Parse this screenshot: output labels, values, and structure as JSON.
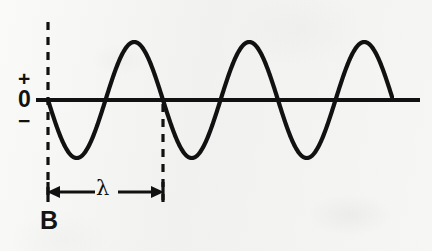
{
  "figure": {
    "panel_letter": "B",
    "background_color": "#f2f2f0",
    "ink_color": "#111111",
    "width": 432,
    "height": 251
  },
  "axis": {
    "plus_label": "+",
    "zero_label": "0",
    "minus_label": "−",
    "baseline_y": 100,
    "x_start": 36,
    "x_end": 420,
    "line_width": 4
  },
  "annotations": {
    "wavelength_symbol": "λ",
    "wavelength_arrow": {
      "y": 192,
      "x_start": 48,
      "x_end": 163,
      "style": "double-headed"
    },
    "marker_lines": [
      {
        "name": "wave-start-marker",
        "x": 48,
        "y_top": 22,
        "y_bottom": 200,
        "style": "dashed"
      },
      {
        "name": "wavelength-end-marker",
        "x": 163,
        "y_top": 104,
        "y_bottom": 200,
        "style": "dashed"
      }
    ]
  },
  "chart_data": {
    "type": "line",
    "title": "",
    "xlabel": "",
    "ylabel": "",
    "subtitle": "",
    "grid": false,
    "legend": null,
    "waveform": "sine",
    "amplitude_px": 58,
    "wavelength_px": 115,
    "cycles_drawn": 3,
    "phase": "starts at zero going negative",
    "x_start": 48,
    "x_end": 392,
    "baseline_y": 100,
    "ylim": [
      -1,
      1
    ],
    "ytick_labels": [
      "+",
      "0",
      "−"
    ],
    "peaks_x": [
      133,
      248,
      365
    ],
    "troughs_x": [
      87,
      202,
      317
    ],
    "zero_crossings_x": [
      48,
      105,
      163,
      220,
      278,
      335,
      392
    ],
    "x": [
      48,
      58,
      68,
      77,
      87,
      96,
      105,
      115,
      124,
      133,
      143,
      153,
      163,
      173,
      182,
      191,
      202,
      211,
      220,
      230,
      239,
      248,
      258,
      268,
      278,
      288,
      297,
      306,
      317,
      326,
      335,
      345,
      354,
      365,
      375,
      384,
      392
    ],
    "y": [
      0,
      -0.52,
      -0.86,
      -0.99,
      -1.0,
      -0.86,
      0,
      0.52,
      0.86,
      1.0,
      0.86,
      0.52,
      0,
      -0.52,
      -0.86,
      -0.99,
      -1.0,
      -0.86,
      0,
      0.52,
      0.86,
      1.0,
      0.86,
      0.52,
      0,
      -0.52,
      -0.86,
      -0.99,
      -1.0,
      -0.86,
      0,
      0.52,
      0.86,
      1.0,
      0.86,
      0.52,
      0
    ]
  }
}
